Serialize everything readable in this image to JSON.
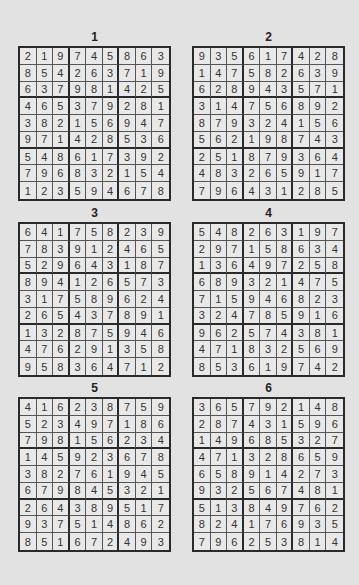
{
  "puzzles": [
    {
      "label": "1",
      "rows": [
        [
          2,
          1,
          9,
          7,
          4,
          5,
          8,
          6,
          3
        ],
        [
          8,
          5,
          4,
          2,
          6,
          3,
          7,
          1,
          9
        ],
        [
          6,
          3,
          7,
          9,
          8,
          1,
          4,
          2,
          5
        ],
        [
          4,
          6,
          5,
          3,
          7,
          9,
          2,
          8,
          1
        ],
        [
          3,
          8,
          2,
          1,
          5,
          6,
          9,
          4,
          7
        ],
        [
          9,
          7,
          1,
          4,
          2,
          8,
          5,
          3,
          6
        ],
        [
          5,
          4,
          8,
          6,
          1,
          7,
          3,
          9,
          2
        ],
        [
          7,
          9,
          6,
          8,
          3,
          2,
          1,
          5,
          4
        ],
        [
          1,
          2,
          3,
          5,
          9,
          4,
          6,
          7,
          8
        ]
      ]
    },
    {
      "label": "2",
      "rows": [
        [
          9,
          3,
          5,
          6,
          1,
          7,
          4,
          2,
          8
        ],
        [
          1,
          4,
          7,
          5,
          8,
          2,
          6,
          3,
          9
        ],
        [
          6,
          2,
          8,
          9,
          4,
          3,
          5,
          7,
          1
        ],
        [
          3,
          1,
          4,
          7,
          5,
          6,
          8,
          9,
          2
        ],
        [
          8,
          7,
          9,
          3,
          2,
          4,
          1,
          5,
          6
        ],
        [
          5,
          6,
          2,
          1,
          9,
          8,
          7,
          4,
          3
        ],
        [
          2,
          5,
          1,
          8,
          7,
          9,
          3,
          6,
          4
        ],
        [
          4,
          8,
          3,
          2,
          6,
          5,
          9,
          1,
          7
        ],
        [
          7,
          9,
          6,
          4,
          3,
          1,
          2,
          8,
          5
        ]
      ]
    },
    {
      "label": "3",
      "rows": [
        [
          6,
          4,
          1,
          7,
          5,
          8,
          2,
          3,
          9
        ],
        [
          7,
          8,
          3,
          9,
          1,
          2,
          4,
          6,
          5
        ],
        [
          5,
          2,
          9,
          6,
          4,
          3,
          1,
          8,
          7
        ],
        [
          8,
          9,
          4,
          1,
          2,
          6,
          5,
          7,
          3
        ],
        [
          3,
          1,
          7,
          5,
          8,
          9,
          6,
          2,
          4
        ],
        [
          2,
          6,
          5,
          4,
          3,
          7,
          8,
          9,
          1
        ],
        [
          1,
          3,
          2,
          8,
          7,
          5,
          9,
          4,
          6
        ],
        [
          4,
          7,
          6,
          2,
          9,
          1,
          3,
          5,
          8
        ],
        [
          9,
          5,
          8,
          3,
          6,
          4,
          7,
          1,
          2
        ]
      ]
    },
    {
      "label": "4",
      "rows": [
        [
          5,
          4,
          8,
          2,
          6,
          3,
          1,
          9,
          7
        ],
        [
          2,
          9,
          7,
          1,
          5,
          8,
          6,
          3,
          4
        ],
        [
          1,
          3,
          6,
          4,
          9,
          7,
          2,
          5,
          8
        ],
        [
          6,
          8,
          9,
          3,
          2,
          1,
          4,
          7,
          5
        ],
        [
          7,
          1,
          5,
          9,
          4,
          6,
          8,
          2,
          3
        ],
        [
          3,
          2,
          4,
          7,
          8,
          5,
          9,
          1,
          6
        ],
        [
          9,
          6,
          2,
          5,
          7,
          4,
          3,
          8,
          1
        ],
        [
          4,
          7,
          1,
          8,
          3,
          2,
          5,
          6,
          9
        ],
        [
          8,
          5,
          3,
          6,
          1,
          9,
          7,
          4,
          2
        ]
      ]
    },
    {
      "label": "5",
      "rows": [
        [
          4,
          1,
          6,
          2,
          3,
          8,
          7,
          5,
          9
        ],
        [
          5,
          2,
          3,
          4,
          9,
          7,
          1,
          8,
          6
        ],
        [
          7,
          9,
          8,
          1,
          5,
          6,
          2,
          3,
          4
        ],
        [
          1,
          4,
          5,
          9,
          2,
          3,
          6,
          7,
          8
        ],
        [
          3,
          8,
          2,
          7,
          6,
          1,
          9,
          4,
          5
        ],
        [
          6,
          7,
          9,
          8,
          4,
          5,
          3,
          2,
          1
        ],
        [
          2,
          6,
          4,
          3,
          8,
          9,
          5,
          1,
          7
        ],
        [
          9,
          3,
          7,
          5,
          1,
          4,
          8,
          6,
          2
        ],
        [
          8,
          5,
          1,
          6,
          7,
          2,
          4,
          9,
          3
        ]
      ]
    },
    {
      "label": "6",
      "rows": [
        [
          3,
          6,
          5,
          7,
          9,
          2,
          1,
          4,
          8
        ],
        [
          2,
          8,
          7,
          4,
          3,
          1,
          5,
          9,
          6
        ],
        [
          1,
          4,
          9,
          6,
          8,
          5,
          3,
          2,
          7
        ],
        [
          4,
          7,
          1,
          3,
          2,
          8,
          6,
          5,
          9
        ],
        [
          6,
          5,
          8,
          9,
          1,
          4,
          2,
          7,
          3
        ],
        [
          9,
          3,
          2,
          5,
          6,
          7,
          4,
          8,
          1
        ],
        [
          5,
          1,
          3,
          8,
          4,
          9,
          7,
          6,
          2
        ],
        [
          8,
          2,
          4,
          1,
          7,
          6,
          9,
          3,
          5
        ],
        [
          7,
          9,
          6,
          2,
          5,
          3,
          8,
          1,
          4
        ]
      ]
    }
  ]
}
